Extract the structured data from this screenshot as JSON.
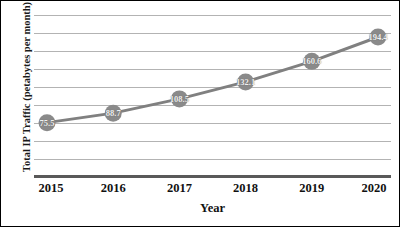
{
  "chart_data": {
    "type": "line",
    "title": "",
    "xlabel": "Year",
    "ylabel": "Total IP Traffic (petabytes per month)",
    "categories": [
      "2015",
      "2016",
      "2017",
      "2018",
      "2019",
      "2020"
    ],
    "x": [
      2015,
      2016,
      2017,
      2018,
      2019,
      2020
    ],
    "values": [
      75.5,
      88.7,
      108.5,
      132.1,
      160.6,
      194.4
    ],
    "point_labels": [
      "75.5",
      "88.7",
      "108.5",
      "132.1",
      "160.6",
      "194.4"
    ],
    "series": [
      {
        "name": "Total IP Traffic",
        "values": [
          75.5,
          88.7,
          108.5,
          132.1,
          160.6,
          194.4
        ]
      }
    ],
    "ylim": [
      0,
      225
    ],
    "xlim": [
      2015,
      2020
    ],
    "ytick_labels": [],
    "gridlines": {
      "horizontal": true,
      "vertical": false,
      "count": 9,
      "color": "#b3b3b3"
    },
    "legend": {
      "visible": false,
      "position": "none"
    },
    "marker": {
      "shape": "circle",
      "color": "#8a8a8a",
      "size": 17
    },
    "line": {
      "color": "#808080",
      "width": 3
    },
    "axis": {
      "baseline_color": "#595959",
      "border_color": "#000000"
    },
    "data_label_color": "#f0f0f0"
  }
}
